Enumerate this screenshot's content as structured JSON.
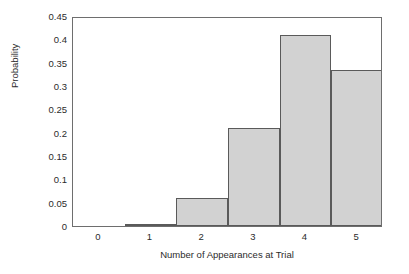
{
  "chart_data": {
    "type": "bar",
    "title": "",
    "xlabel": "Number of Appearances at Trial",
    "ylabel": "Probability",
    "categories": [
      "0",
      "1",
      "2",
      "3",
      "4",
      "5"
    ],
    "values": [
      0,
      0.005,
      0.06,
      0.21,
      0.41,
      0.335
    ],
    "xlim": [
      -0.5,
      5.5
    ],
    "ylim": [
      0,
      0.45
    ],
    "xticks": [
      "0",
      "1",
      "2",
      "3",
      "4",
      "5"
    ],
    "yticks": [
      "0",
      "0.05",
      "0.1",
      "0.15",
      "0.2",
      "0.25",
      "0.3",
      "0.35",
      "0.4",
      "0.45"
    ],
    "ytick_values": [
      0,
      0.05,
      0.1,
      0.15,
      0.2,
      0.25,
      0.3,
      0.35,
      0.4,
      0.45
    ],
    "bar_width": 1,
    "grid": false,
    "legend": false,
    "legend_position": "none",
    "colors": {
      "bar_fill": "#d2d2d2",
      "bar_edge": "#5a5a5a",
      "frame": "#6e6e6e",
      "text": "#2b2b2b",
      "background": "#ffffff"
    }
  }
}
